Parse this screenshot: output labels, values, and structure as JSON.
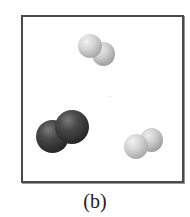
{
  "figure": {
    "caption": "(b)",
    "frame_color": "#4a4a4a",
    "molecules": [
      {
        "name": "light-diatomic-top",
        "shade": "light",
        "atoms": 2,
        "position": "top-center"
      },
      {
        "name": "dark-diatomic-left",
        "shade": "dark",
        "atoms": 2,
        "position": "lower-left"
      },
      {
        "name": "light-diatomic-right",
        "shade": "light",
        "atoms": 2,
        "position": "lower-right"
      }
    ]
  }
}
